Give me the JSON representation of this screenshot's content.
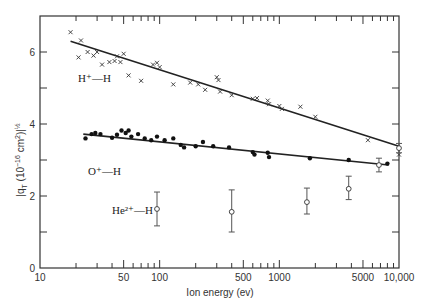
{
  "chart_data": {
    "type": "scatter",
    "title": "",
    "xlabel": "Ion energy (ev)",
    "ylabel": "|q_T (10^-16 cm^2)|^1/2",
    "xscale": "log",
    "xlim": [
      10,
      10000
    ],
    "ylim": [
      0,
      7
    ],
    "x_ticks": [
      10,
      50,
      100,
      500,
      1000,
      5000,
      10000
    ],
    "x_tick_labels": [
      "10",
      "50",
      "100",
      "500",
      "1000",
      "5000",
      "10,000"
    ],
    "y_ticks": [
      0,
      2,
      4,
      6
    ],
    "y_tick_labels": [
      "0",
      "2",
      "4",
      "6"
    ],
    "grid": false,
    "legend": "inline labels",
    "series": [
      {
        "name": "H+—H",
        "label_html": "H⁺—H",
        "marker": "x",
        "points": [
          [
            18,
            6.55
          ],
          [
            22,
            6.32
          ],
          [
            21,
            5.85
          ],
          [
            25,
            6.0
          ],
          [
            28,
            5.9
          ],
          [
            30,
            6.0
          ],
          [
            33,
            5.65
          ],
          [
            38,
            5.72
          ],
          [
            42,
            5.75
          ],
          [
            44,
            5.88
          ],
          [
            47,
            5.72
          ],
          [
            50,
            5.95
          ],
          [
            55,
            5.35
          ],
          [
            70,
            5.2
          ],
          [
            88,
            5.65
          ],
          [
            95,
            5.7
          ],
          [
            100,
            5.58
          ],
          [
            130,
            5.1
          ],
          [
            180,
            5.15
          ],
          [
            210,
            5.1
          ],
          [
            240,
            4.95
          ],
          [
            300,
            5.3
          ],
          [
            310,
            5.22
          ],
          [
            320,
            4.9
          ],
          [
            400,
            4.8
          ],
          [
            600,
            4.7
          ],
          [
            650,
            4.72
          ],
          [
            800,
            4.65
          ],
          [
            820,
            4.55
          ],
          [
            1000,
            4.5
          ],
          [
            1050,
            4.42
          ],
          [
            1500,
            4.48
          ],
          [
            2000,
            4.2
          ],
          [
            5500,
            3.55
          ],
          [
            10000,
            3.15
          ]
        ],
        "fit_line": [
          [
            18,
            6.3
          ],
          [
            10000,
            3.38
          ]
        ]
      },
      {
        "name": "O+—H",
        "label_html": "O⁺—H",
        "marker": "filled-circle",
        "points": [
          [
            24,
            3.6
          ],
          [
            27,
            3.72
          ],
          [
            29,
            3.75
          ],
          [
            32,
            3.72
          ],
          [
            40,
            3.62
          ],
          [
            44,
            3.7
          ],
          [
            48,
            3.82
          ],
          [
            52,
            3.75
          ],
          [
            55,
            3.82
          ],
          [
            58,
            3.65
          ],
          [
            66,
            3.72
          ],
          [
            75,
            3.6
          ],
          [
            85,
            3.55
          ],
          [
            95,
            3.65
          ],
          [
            110,
            3.55
          ],
          [
            130,
            3.6
          ],
          [
            150,
            3.42
          ],
          [
            160,
            3.35
          ],
          [
            200,
            3.38
          ],
          [
            230,
            3.5
          ],
          [
            280,
            3.38
          ],
          [
            380,
            3.35
          ],
          [
            600,
            3.22
          ],
          [
            620,
            3.15
          ],
          [
            800,
            3.2
          ],
          [
            820,
            3.08
          ],
          [
            1800,
            3.05
          ],
          [
            3800,
            3.0
          ],
          [
            8000,
            2.9
          ]
        ],
        "fit_line": [
          [
            23,
            3.72
          ],
          [
            8200,
            2.86
          ]
        ]
      },
      {
        "name": "He2+—H",
        "label_html": "He²⁺—H",
        "marker": "open-circle-errorbar",
        "points": [
          {
            "x": 95,
            "y": 1.64,
            "ymin": 1.17,
            "ymax": 2.11
          },
          {
            "x": 400,
            "y": 1.56,
            "ymin": 1.0,
            "ymax": 2.17
          },
          {
            "x": 1700,
            "y": 1.83,
            "ymin": 1.5,
            "ymax": 2.22
          },
          {
            "x": 3800,
            "y": 2.2,
            "ymin": 1.9,
            "ymax": 2.55
          },
          {
            "x": 6800,
            "y": 2.86,
            "ymin": 2.67,
            "ymax": 3.05
          },
          {
            "x": 10000,
            "y": 3.33,
            "ymin": 3.2,
            "ymax": 3.46
          }
        ]
      }
    ],
    "annotations": [
      {
        "text": "H⁺—H",
        "x": 12,
        "y": 5.4
      },
      {
        "text": "O⁺—H",
        "x": 14,
        "y": 3.3
      },
      {
        "text": "He²⁺—H",
        "x": 30,
        "y": 1.6
      }
    ]
  },
  "labels": {
    "xlabel": "Ion energy (ev)",
    "ylabel_main": "|q",
    "ylabel_sub": "T",
    "ylabel_rest": " (10",
    "ylabel_exp": "−16",
    "ylabel_unit": " cm",
    "ylabel_unit_exp": "2",
    "ylabel_close": ")|",
    "ylabel_power": "½",
    "series_h": "H⁺—H",
    "series_o": "O⁺—H",
    "series_he": "He²⁺—H"
  }
}
